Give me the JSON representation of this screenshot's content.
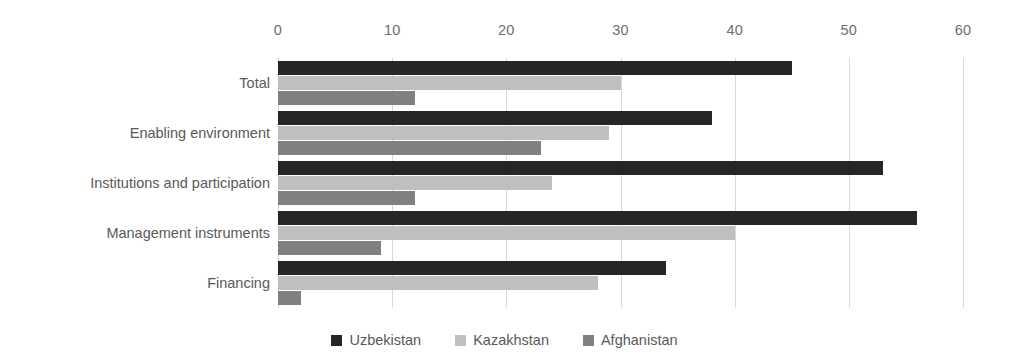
{
  "chart_data": {
    "type": "bar",
    "orientation": "horizontal",
    "title": "",
    "subtitle": "",
    "xlabel": "",
    "ylabel": "",
    "xlim": [
      0,
      60
    ],
    "xticks": [
      0,
      10,
      20,
      30,
      40,
      50,
      60
    ],
    "xtick_labels": [
      "0",
      "10",
      "20",
      "30",
      "40",
      "50",
      "60"
    ],
    "grid": true,
    "grid_axis": "x",
    "legend_position": "bottom",
    "axis_position": "top",
    "categories": [
      "Total",
      "Enabling environment",
      "Institutions and participation",
      "Management instruments",
      "Financing"
    ],
    "series": [
      {
        "name": "Uzbekistan",
        "color": "#262626",
        "values": [
          45,
          38,
          53,
          56,
          34
        ]
      },
      {
        "name": "Kazakhstan",
        "color": "#bfbfbf",
        "values": [
          30,
          29,
          24,
          40,
          28
        ]
      },
      {
        "name": "Afghanistan",
        "color": "#808080",
        "values": [
          12,
          23,
          12,
          9,
          2
        ]
      }
    ]
  },
  "legend": {
    "items": [
      {
        "label": "Uzbekistan",
        "color": "#262626"
      },
      {
        "label": "Kazakhstan",
        "color": "#bfbfbf"
      },
      {
        "label": "Afghanistan",
        "color": "#808080"
      }
    ]
  }
}
